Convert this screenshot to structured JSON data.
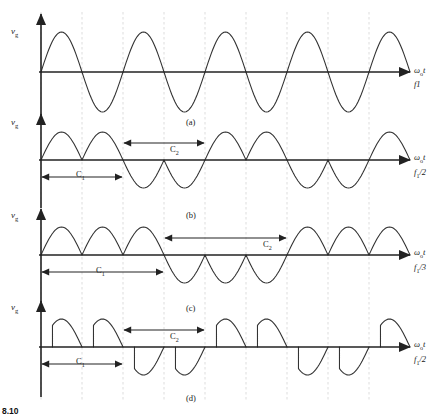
{
  "figure": {
    "caption_number": "8.10",
    "panels": [
      {
        "id": "a",
        "caption": "(a)",
        "y_axis_label": "v",
        "y_axis_sub": "g",
        "x_axis_label": "ω",
        "x_axis_sub": "o",
        "x_axis_label_tail": "t",
        "frequency_label": "f1",
        "frequency_sub": "",
        "intervals": []
      },
      {
        "id": "b",
        "caption": "(b)",
        "y_axis_label": "v",
        "y_axis_sub": "g",
        "x_axis_label": "ω",
        "x_axis_sub": "o",
        "x_axis_label_tail": "t",
        "frequency_label": "f",
        "frequency_sub": "1",
        "frequency_tail": "/2",
        "intervals": [
          {
            "name": "C",
            "sub": "1"
          },
          {
            "name": "C",
            "sub": "2"
          }
        ]
      },
      {
        "id": "c",
        "caption": "(c)",
        "y_axis_label": "v",
        "y_axis_sub": "g",
        "x_axis_label": "ω",
        "x_axis_sub": "o",
        "x_axis_label_tail": "t",
        "frequency_label": "f",
        "frequency_sub": "1",
        "frequency_tail": "/3",
        "intervals": [
          {
            "name": "C",
            "sub": "1"
          },
          {
            "name": "C",
            "sub": "2"
          }
        ]
      },
      {
        "id": "d",
        "caption": "(d)",
        "y_axis_label": "v",
        "y_axis_sub": "g",
        "x_axis_label": "ω",
        "x_axis_sub": "o",
        "x_axis_label_tail": "t",
        "frequency_label": "f",
        "frequency_sub": "1",
        "frequency_tail": "/2",
        "intervals": [
          {
            "name": "C",
            "sub": "1"
          },
          {
            "name": "C",
            "sub": "2"
          }
        ]
      }
    ]
  },
  "chart_data": {
    "type": "line",
    "title": "",
    "xlabel": "ω₀t",
    "ylabel": "v_g",
    "grid": "vertical dashed gridlines every half cycle",
    "legend": "none",
    "panels": [
      {
        "id": "a",
        "caption": "(a)",
        "description": "Continuous sinusoid at supply frequency f1",
        "output_frequency": "f1",
        "half_cycles_shown": 9,
        "baseline_y": 72,
        "amplitude": 40,
        "half_cycle_width": 41,
        "x_start": 41,
        "waveform": "full-sine",
        "polarity_pattern": [
          1,
          -1,
          1,
          -1,
          1,
          -1,
          1,
          -1,
          1
        ]
      },
      {
        "id": "b",
        "caption": "(b)",
        "description": "Cycloconverter output at f1/2: two positive half-cycles from converter C1 followed by two negative half-cycles from converter C2",
        "output_frequency": "f1/2",
        "half_cycles_shown": 9,
        "baseline_y": 160,
        "amplitude": 28,
        "half_cycle_width": 41,
        "x_start": 41,
        "waveform": "half-sine-groups",
        "group_size": 2,
        "polarity_pattern": [
          1,
          1,
          -1,
          -1,
          1,
          1,
          -1,
          -1,
          1
        ],
        "annotations": [
          {
            "label": "C",
            "sub": "1",
            "from_half_cycle": 0,
            "to_half_cycle": 2,
            "side": "below"
          },
          {
            "label": "C",
            "sub": "2",
            "from_half_cycle": 2,
            "to_half_cycle": 4,
            "side": "above"
          }
        ]
      },
      {
        "id": "c",
        "caption": "(c)",
        "description": "Cycloconverter output at f1/3: three positive half-cycles from converter C1 followed by three negative half-cycles from converter C2",
        "output_frequency": "f1/3",
        "half_cycles_shown": 9,
        "baseline_y": 255,
        "amplitude": 28,
        "half_cycle_width": 41,
        "x_start": 41,
        "waveform": "half-sine-groups",
        "group_size": 3,
        "polarity_pattern": [
          1,
          1,
          1,
          -1,
          -1,
          -1,
          1,
          1,
          1
        ],
        "annotations": [
          {
            "label": "C",
            "sub": "1",
            "from_half_cycle": 0,
            "to_half_cycle": 3,
            "side": "below"
          },
          {
            "label": "C",
            "sub": "2",
            "from_half_cycle": 3,
            "to_half_cycle": 6,
            "side": "above"
          }
        ]
      },
      {
        "id": "d",
        "caption": "(d)",
        "description": "Phase-controlled cycloconverter output at f1/2 with firing-angle delay: chopped half-cycles with vertical leading edges",
        "output_frequency": "f1/2",
        "half_cycles_shown": 9,
        "baseline_y": 347,
        "amplitude": 28,
        "half_cycle_width": 41,
        "x_start": 41,
        "waveform": "phase-delayed-half-sine-groups",
        "firing_angle_fraction": 0.28,
        "group_size": 2,
        "polarity_pattern": [
          1,
          1,
          -1,
          -1,
          1,
          1,
          -1,
          -1,
          1
        ],
        "annotations": [
          {
            "label": "C",
            "sub": "1",
            "from_half_cycle": 0,
            "to_half_cycle": 2,
            "side": "below"
          },
          {
            "label": "C",
            "sub": "2",
            "from_half_cycle": 2,
            "to_half_cycle": 4,
            "side": "above"
          }
        ]
      }
    ]
  }
}
